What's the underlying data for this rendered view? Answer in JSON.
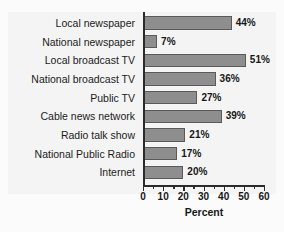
{
  "chart_data": {
    "type": "bar",
    "orientation": "horizontal",
    "title": "",
    "xlabel": "Percent",
    "ylabel": "",
    "xlim": [
      0,
      60
    ],
    "xticks": [
      0,
      10,
      20,
      30,
      40,
      50,
      60
    ],
    "xtick_labels": [
      "0",
      "10",
      "20",
      "30",
      "40",
      "50",
      "60"
    ],
    "minor_tick_step": 5,
    "grid": false,
    "legend": false,
    "value_label_suffix": "%",
    "categories": [
      "Local newspaper",
      "National newspaper",
      "Local broadcast TV",
      "National broadcast TV",
      "Public TV",
      "Cable news network",
      "Radio talk show",
      "National Public Radio",
      "Internet"
    ],
    "values": [
      44,
      7,
      51,
      36,
      27,
      39,
      21,
      17,
      20
    ],
    "value_labels": [
      "44%",
      "7%",
      "51%",
      "36%",
      "27%",
      "39%",
      "21%",
      "17%",
      "20%"
    ],
    "colors": {
      "bar_fill": "#8e8e8e",
      "bar_edge": "#5a5a5a",
      "axis": "#2b2b2b",
      "text": "#161616",
      "panel_background": "#f4f4f4",
      "figure_background": "#fbfbfb"
    }
  }
}
